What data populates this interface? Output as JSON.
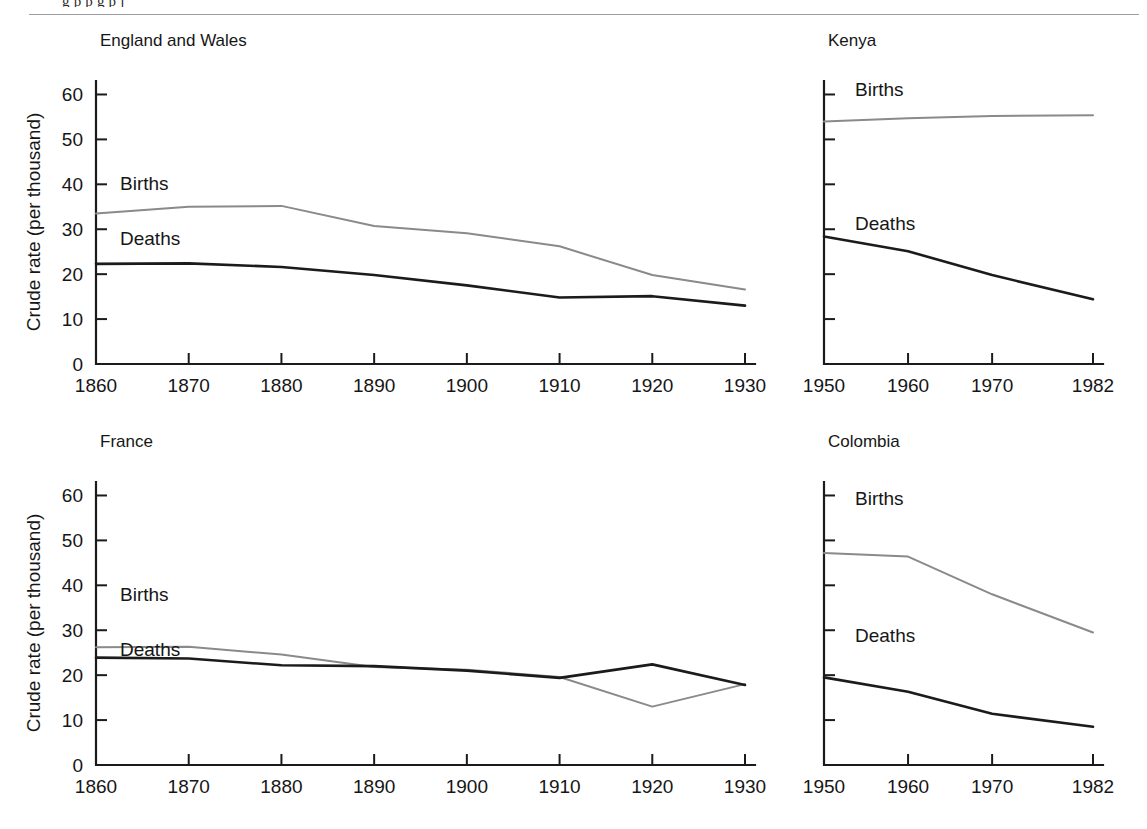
{
  "figure": {
    "top_cut_text": "g p p g   p j",
    "background_color": "#ffffff",
    "rule_color": "#9b9ba0"
  },
  "series_style": {
    "births_color": "#8a8a8a",
    "births_width": 2.0,
    "deaths_color": "#1b1b1b",
    "deaths_width": 2.6
  },
  "panels": [
    {
      "id": "england-and-wales",
      "title": "England and Wales",
      "axis_title": "Crude rate (per thousand)",
      "y_ticks": [
        "60",
        "50",
        "40",
        "30",
        "20",
        "10",
        "0"
      ],
      "x_ticks": [
        "1860",
        "1870",
        "1880",
        "1890",
        "1900",
        "1910",
        "1920",
        "1930"
      ],
      "births_label": "Births",
      "deaths_label": "Deaths"
    },
    {
      "id": "kenya",
      "title": "Kenya",
      "axis_title": "",
      "y_ticks": [
        "",
        "",
        "",
        "",
        "",
        "",
        ""
      ],
      "x_ticks": [
        "1950",
        "1960",
        "1970",
        "1982"
      ],
      "births_label": "Births",
      "deaths_label": "Deaths"
    },
    {
      "id": "france",
      "title": "France",
      "axis_title": "Crude rate (per thousand)",
      "y_ticks": [
        "60",
        "50",
        "40",
        "30",
        "20",
        "10",
        "0"
      ],
      "x_ticks": [
        "1860",
        "1870",
        "1880",
        "1890",
        "1900",
        "1910",
        "1920",
        "1930"
      ],
      "births_label": "Births",
      "deaths_label": "Deaths"
    },
    {
      "id": "colombia",
      "title": "Colombia",
      "axis_title": "",
      "y_ticks": [
        "",
        "",
        "",
        "",
        "",
        "",
        ""
      ],
      "x_ticks": [
        "1950",
        "1960",
        "1970",
        "1982"
      ],
      "births_label": "Births",
      "deaths_label": "Deaths"
    }
  ],
  "chart_data": [
    {
      "type": "line",
      "title": "England and Wales",
      "xlabel": "",
      "ylabel": "Crude rate (per thousand)",
      "x": [
        1860,
        1870,
        1880,
        1890,
        1900,
        1910,
        1920,
        1930
      ],
      "xlim": [
        1860,
        1930
      ],
      "ylim": [
        0,
        63
      ],
      "yticks": [
        0,
        10,
        20,
        30,
        40,
        50,
        60
      ],
      "xticks": [
        1860,
        1870,
        1880,
        1890,
        1900,
        1910,
        1920,
        1930
      ],
      "grid": false,
      "legend": "inline-annotations",
      "series": [
        {
          "name": "Births",
          "values": [
            33.5,
            35.0,
            35.2,
            30.7,
            29.1,
            26.2,
            19.8,
            16.6
          ]
        },
        {
          "name": "Deaths",
          "values": [
            22.3,
            22.4,
            21.6,
            19.8,
            17.5,
            14.8,
            15.1,
            13.0
          ]
        }
      ]
    },
    {
      "type": "line",
      "title": "Kenya",
      "xlabel": "",
      "ylabel": "",
      "x": [
        1950,
        1960,
        1970,
        1982
      ],
      "xlim": [
        1950,
        1982
      ],
      "ylim": [
        0,
        63
      ],
      "yticks": [
        0,
        10,
        20,
        30,
        40,
        50,
        60
      ],
      "xticks": [
        1950,
        1960,
        1970,
        1982
      ],
      "grid": false,
      "legend": "inline-annotations",
      "series": [
        {
          "name": "Births",
          "values": [
            54.0,
            54.7,
            55.2,
            55.4
          ]
        },
        {
          "name": "Deaths",
          "values": [
            28.4,
            25.1,
            19.8,
            14.4
          ]
        }
      ]
    },
    {
      "type": "line",
      "title": "France",
      "xlabel": "",
      "ylabel": "Crude rate (per thousand)",
      "x": [
        1860,
        1870,
        1880,
        1890,
        1900,
        1910,
        1920,
        1930
      ],
      "xlim": [
        1860,
        1930
      ],
      "ylim": [
        0,
        63
      ],
      "yticks": [
        0,
        10,
        20,
        30,
        40,
        50,
        60
      ],
      "xticks": [
        1860,
        1870,
        1880,
        1890,
        1900,
        1910,
        1920,
        1930
      ],
      "grid": false,
      "legend": "inline-annotations",
      "series": [
        {
          "name": "Births",
          "values": [
            26.2,
            26.3,
            24.6,
            21.8,
            21.2,
            19.6,
            13.0,
            18.0
          ]
        },
        {
          "name": "Deaths",
          "values": [
            23.9,
            23.7,
            22.2,
            22.0,
            21.0,
            19.4,
            22.4,
            17.8
          ]
        }
      ]
    },
    {
      "type": "line",
      "title": "Colombia",
      "xlabel": "",
      "ylabel": "",
      "x": [
        1950,
        1960,
        1970,
        1982
      ],
      "xlim": [
        1950,
        1982
      ],
      "ylim": [
        0,
        63
      ],
      "yticks": [
        0,
        10,
        20,
        30,
        40,
        50,
        60
      ],
      "xticks": [
        1950,
        1960,
        1970,
        1982
      ],
      "grid": false,
      "legend": "inline-annotations",
      "series": [
        {
          "name": "Births",
          "values": [
            47.2,
            46.4,
            38.0,
            29.5
          ]
        },
        {
          "name": "Deaths",
          "values": [
            19.5,
            16.3,
            11.4,
            8.5
          ]
        }
      ]
    }
  ]
}
